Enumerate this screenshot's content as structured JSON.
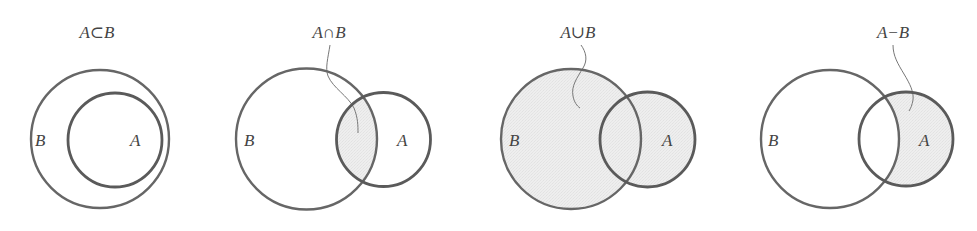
{
  "colors": {
    "stroke": "#666666",
    "stroke_a": "#5a5a5a",
    "fill_shaded": "#ebebeb",
    "leader": "#777777",
    "text": "#444444",
    "background": "#ffffff"
  },
  "panels": [
    {
      "id": "subset",
      "title": "A⊂B",
      "title_pos": [
        97,
        38
      ],
      "shaded_region": "none",
      "circle_b": {
        "label": "B",
        "cx": 100,
        "cy": 139,
        "r": 69,
        "label_pos": [
          35,
          146
        ]
      },
      "circle_a": {
        "label": "A",
        "cx": 115,
        "cy": 140,
        "r": 47,
        "label_pos": [
          130,
          146
        ]
      },
      "leader": null
    },
    {
      "id": "intersection",
      "title": "A∩B",
      "title_pos": [
        329,
        38
      ],
      "shaded_region": "A ∩ B",
      "circle_b": {
        "label": "B",
        "cx": 306.5,
        "cy": 139,
        "r": 70.5,
        "label_pos": [
          244,
          146
        ]
      },
      "circle_a": {
        "label": "A",
        "cx": 383.5,
        "cy": 139.5,
        "r": 47,
        "label_pos": [
          397,
          146
        ]
      },
      "leader": "M330,45 C328,58 325,68 328,76 C333,88 348,96 354,108 C358,118 358,126 358,133"
    },
    {
      "id": "union",
      "title": "A∪B",
      "title_pos": [
        578,
        38
      ],
      "shaded_region": "A ∪ B",
      "circle_b": {
        "label": "B",
        "cx": 571,
        "cy": 139,
        "r": 70,
        "label_pos": [
          509,
          146
        ]
      },
      "circle_a": {
        "label": "A",
        "cx": 647.5,
        "cy": 139.5,
        "r": 47.5,
        "label_pos": [
          662,
          146
        ]
      },
      "leader": "M581,45 C586,52 588,60 583,68 C577,78 571,86 573,96 C574,102 577,106 580,108"
    },
    {
      "id": "difference",
      "title": "A−B",
      "title_pos": [
        893,
        38
      ],
      "shaded_region": "A − B",
      "circle_b": {
        "label": "B",
        "cx": 830,
        "cy": 139,
        "r": 69,
        "label_pos": [
          768,
          146
        ]
      },
      "circle_a": {
        "label": "A",
        "cx": 906,
        "cy": 139,
        "r": 47,
        "label_pos": [
          919,
          146
        ]
      },
      "leader": "M893,45 C893,56 898,64 904,74 C910,84 914,92 913,100 C912,105 911,108 909,111"
    }
  ]
}
